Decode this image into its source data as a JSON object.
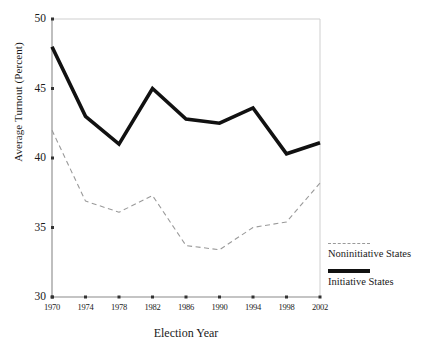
{
  "chart_data": {
    "type": "line",
    "title": "",
    "xlabel": "Election Year",
    "ylabel": "Average Turnout (Percent)",
    "x": [
      1970,
      1974,
      1978,
      1982,
      1986,
      1990,
      1994,
      1998,
      2002
    ],
    "xtick_labels": [
      "1970",
      "1974",
      "1978",
      "1982",
      "1986",
      "1990",
      "1994",
      "1998",
      "2002"
    ],
    "ytick_labels": [
      "30",
      "35",
      "40",
      "45",
      "50"
    ],
    "yticks": [
      30,
      35,
      40,
      45,
      50
    ],
    "xlim": [
      1970,
      2002
    ],
    "ylim": [
      30,
      50
    ],
    "grid": false,
    "legend_position": "right-bottom",
    "series": [
      {
        "name": "Noninitiative States",
        "style": "dashed",
        "color": "#9a9a9a",
        "values": [
          42.0,
          36.9,
          36.1,
          37.3,
          33.7,
          33.4,
          35.0,
          35.4,
          38.2
        ]
      },
      {
        "name": "Initiative States",
        "style": "solid-thick",
        "color": "#111111",
        "values": [
          48.0,
          43.0,
          41.0,
          45.0,
          42.8,
          42.5,
          43.6,
          40.3,
          41.1
        ]
      }
    ]
  },
  "legend": {
    "entries": [
      {
        "label": "Noninitiative States"
      },
      {
        "label": "Initiative States"
      }
    ]
  }
}
